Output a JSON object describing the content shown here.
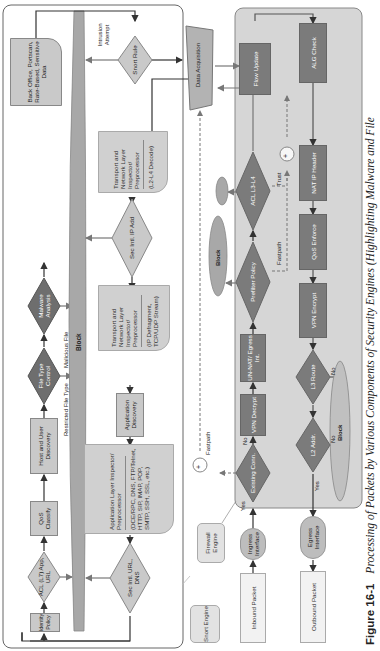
{
  "caption": {
    "figure_number": "Figure 16-1",
    "text": "Processing of Packets by Various Components of Security Engines (Highlighting Malware and File Policy Components)",
    "visible_text": "Processing of Packets by Various Components of Security Engines (Highlighting Malware and File"
  },
  "legend": {
    "snort_engine": "Snort Engine",
    "firewall_engine": "Firewall Engine"
  },
  "io": {
    "inbound_packet": "Inbound Packet",
    "outbound_packet": "Outbound Packet",
    "ingress_interface": "Ingress Interface",
    "egress_interface": "Egress Interface",
    "data_acquisition": "Data Acquisition"
  },
  "firewall": {
    "existing_conn": "Existing Conn.",
    "vpn_decrypt": "VPN Decrypt",
    "un_nat": "UN-NAT/ Egress Int.",
    "prefilter_policy": "Prefilter Policy",
    "acl_l3_l4": "ACL L3-L4",
    "flow_update": "Flow Update",
    "alg_check": "ALG Check",
    "nat_ip_header": "NAT IP Header",
    "qos_enforce": "QoS Enforce",
    "vpn_encrypt": "VPN Encrypt",
    "l3_route": "L3 Route",
    "l2_addr": "L2 Addr.",
    "block_inner": "Block",
    "block_outer": "Block",
    "labels": {
      "yes_existing": "Yes",
      "no_existing": "No",
      "fastpath_top": "Fastpath",
      "fastpath_prefilter": "Fastpath",
      "trust": "Trust",
      "no_l3": "No",
      "no_l2": "No",
      "yes_l2": "Yes"
    }
  },
  "snort": {
    "identity_policy": "Identity Policy",
    "acl_l7": "ACL (L7) App, URL",
    "qos_classify": "QoS Classify",
    "host_user_discovery": "Host and User Discovery",
    "file_type_control": "File Type Control",
    "malware_analysis": "Malware Analysis",
    "back_office": "Back Office, Portscan, Rate-Based, Sensitive Data",
    "short_rule": "Snort Rule",
    "sec_intl_ip": "Sec Intl. IP Add",
    "sec_intl_url": "Sec Intl. URL, DNS",
    "app_discovery": "Application Discovery",
    "block_bar": "Block",
    "transport_l2l4": {
      "title": "Transport and Network Layer Inspector/ Preprocessor",
      "sub": "(L2-L4 Decode)"
    },
    "transport_defrag": {
      "title": "Transport and Network Layer Inspector/ Preprocessor",
      "sub": "(IP Defragment, TCP/UDP Stream)"
    },
    "app_layer": {
      "title": "Application Layer Inspector/ Preprocessor",
      "sub": "(DCE/RPC, DNS, FTP/Telnet, HTTP, SIP, IMAP, POP, SMTP, SSH, SSL, etc.)"
    },
    "labels": {
      "restricted_file_type": "Restricted File Type",
      "malicious_file": "Malicious File",
      "intrusion_attempt": "Intrusion Attempt"
    }
  },
  "colors": {
    "light_node": "#c9c9c9",
    "dark_node": "#7b7b7b",
    "firewall_bg": "#d6d6d6",
    "block_bar": "#a8a8a8",
    "arrow": "#333333"
  }
}
